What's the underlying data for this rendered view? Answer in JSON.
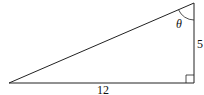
{
  "diagram": {
    "type": "right-triangle",
    "labels": {
      "base": "12",
      "height": "5",
      "angle": "θ"
    },
    "right_angle_marker": true,
    "angle_arc_at": "top vertex",
    "colors": {
      "stroke": "#222222",
      "background": "#ffffff"
    }
  }
}
